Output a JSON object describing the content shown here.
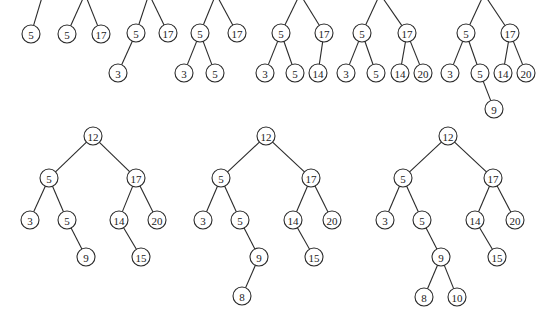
{
  "diagram": {
    "title": "",
    "style": {
      "stroke": "#2a2a2a",
      "node_fill": "#ffffff",
      "text": "#222222",
      "radius": 9
    },
    "trees": [
      {
        "name": "tree-1",
        "nodes": [
          {
            "id": "r",
            "label": "",
            "x": 43,
            "y": -6,
            "hidden": true
          },
          {
            "id": "a",
            "label": "5",
            "x": 31,
            "y": 34
          }
        ],
        "edges": [
          [
            "r",
            "a"
          ]
        ]
      },
      {
        "name": "tree-2",
        "nodes": [
          {
            "id": "r",
            "label": "",
            "x": 85,
            "y": -6,
            "hidden": true
          },
          {
            "id": "a",
            "label": "5",
            "x": 67,
            "y": 34
          },
          {
            "id": "b",
            "label": "17",
            "x": 101,
            "y": 34
          }
        ],
        "edges": [
          [
            "r",
            "a"
          ],
          [
            "r",
            "b"
          ]
        ]
      },
      {
        "name": "tree-3",
        "nodes": [
          {
            "id": "r",
            "label": "",
            "x": 149,
            "y": -6,
            "hidden": true
          },
          {
            "id": "a",
            "label": "5",
            "x": 136,
            "y": 33
          },
          {
            "id": "b",
            "label": "17",
            "x": 168,
            "y": 33
          },
          {
            "id": "c",
            "label": "3",
            "x": 118,
            "y": 73
          }
        ],
        "edges": [
          [
            "r",
            "a"
          ],
          [
            "r",
            "b"
          ],
          [
            "a",
            "c"
          ]
        ]
      },
      {
        "name": "tree-4",
        "nodes": [
          {
            "id": "r",
            "label": "",
            "x": 216,
            "y": -6,
            "hidden": true
          },
          {
            "id": "a",
            "label": "5",
            "x": 200,
            "y": 33
          },
          {
            "id": "b",
            "label": "17",
            "x": 237,
            "y": 33
          },
          {
            "id": "c",
            "label": "3",
            "x": 184,
            "y": 73
          },
          {
            "id": "d",
            "label": "5",
            "x": 215,
            "y": 73
          }
        ],
        "edges": [
          [
            "r",
            "a"
          ],
          [
            "r",
            "b"
          ],
          [
            "a",
            "c"
          ],
          [
            "a",
            "d"
          ]
        ]
      },
      {
        "name": "tree-5",
        "nodes": [
          {
            "id": "r",
            "label": "",
            "x": 300,
            "y": -6,
            "hidden": true
          },
          {
            "id": "a",
            "label": "5",
            "x": 281,
            "y": 33
          },
          {
            "id": "b",
            "label": "17",
            "x": 324,
            "y": 33
          },
          {
            "id": "c",
            "label": "3",
            "x": 265,
            "y": 73
          },
          {
            "id": "d",
            "label": "5",
            "x": 295,
            "y": 73
          },
          {
            "id": "e",
            "label": "14",
            "x": 318,
            "y": 73
          }
        ],
        "edges": [
          [
            "r",
            "a"
          ],
          [
            "r",
            "b"
          ],
          [
            "a",
            "c"
          ],
          [
            "a",
            "d"
          ],
          [
            "b",
            "e"
          ]
        ]
      },
      {
        "name": "tree-6",
        "nodes": [
          {
            "id": "r",
            "label": "",
            "x": 380,
            "y": -6,
            "hidden": true
          },
          {
            "id": "a",
            "label": "5",
            "x": 362,
            "y": 33
          },
          {
            "id": "b",
            "label": "17",
            "x": 407,
            "y": 33
          },
          {
            "id": "c",
            "label": "3",
            "x": 346,
            "y": 73
          },
          {
            "id": "d",
            "label": "5",
            "x": 376,
            "y": 73
          },
          {
            "id": "e",
            "label": "14",
            "x": 400,
            "y": 73
          },
          {
            "id": "f",
            "label": "20",
            "x": 423,
            "y": 73
          }
        ],
        "edges": [
          [
            "r",
            "a"
          ],
          [
            "r",
            "b"
          ],
          [
            "a",
            "c"
          ],
          [
            "a",
            "d"
          ],
          [
            "b",
            "e"
          ],
          [
            "b",
            "f"
          ]
        ]
      },
      {
        "name": "tree-7",
        "nodes": [
          {
            "id": "r",
            "label": "",
            "x": 484,
            "y": -6,
            "hidden": true
          },
          {
            "id": "a",
            "label": "5",
            "x": 466,
            "y": 33
          },
          {
            "id": "b",
            "label": "17",
            "x": 510,
            "y": 33
          },
          {
            "id": "c",
            "label": "3",
            "x": 450,
            "y": 73
          },
          {
            "id": "d",
            "label": "5",
            "x": 480,
            "y": 73
          },
          {
            "id": "e",
            "label": "14",
            "x": 503,
            "y": 73
          },
          {
            "id": "f",
            "label": "20",
            "x": 526,
            "y": 73
          },
          {
            "id": "g",
            "label": "9",
            "x": 494,
            "y": 109
          }
        ],
        "edges": [
          [
            "r",
            "a"
          ],
          [
            "r",
            "b"
          ],
          [
            "a",
            "c"
          ],
          [
            "a",
            "d"
          ],
          [
            "b",
            "e"
          ],
          [
            "b",
            "f"
          ],
          [
            "d",
            "g"
          ]
        ]
      },
      {
        "name": "tree-8",
        "nodes": [
          {
            "id": "r",
            "label": "12",
            "x": 93,
            "y": 136
          },
          {
            "id": "a",
            "label": "5",
            "x": 49,
            "y": 178
          },
          {
            "id": "b",
            "label": "17",
            "x": 136,
            "y": 178
          },
          {
            "id": "c",
            "label": "3",
            "x": 30,
            "y": 220
          },
          {
            "id": "d",
            "label": "5",
            "x": 67,
            "y": 220
          },
          {
            "id": "e",
            "label": "14",
            "x": 119,
            "y": 220
          },
          {
            "id": "f",
            "label": "20",
            "x": 157,
            "y": 220
          },
          {
            "id": "g",
            "label": "9",
            "x": 86,
            "y": 257
          },
          {
            "id": "h",
            "label": "15",
            "x": 141,
            "y": 257
          }
        ],
        "edges": [
          [
            "r",
            "a"
          ],
          [
            "r",
            "b"
          ],
          [
            "a",
            "c"
          ],
          [
            "a",
            "d"
          ],
          [
            "b",
            "e"
          ],
          [
            "b",
            "f"
          ],
          [
            "d",
            "g"
          ],
          [
            "e",
            "h"
          ]
        ]
      },
      {
        "name": "tree-9",
        "nodes": [
          {
            "id": "r",
            "label": "12",
            "x": 266,
            "y": 136
          },
          {
            "id": "a",
            "label": "5",
            "x": 221,
            "y": 178
          },
          {
            "id": "b",
            "label": "17",
            "x": 311,
            "y": 178
          },
          {
            "id": "c",
            "label": "3",
            "x": 203,
            "y": 220
          },
          {
            "id": "d",
            "label": "5",
            "x": 240,
            "y": 220
          },
          {
            "id": "e",
            "label": "14",
            "x": 293,
            "y": 220
          },
          {
            "id": "f",
            "label": "20",
            "x": 332,
            "y": 220
          },
          {
            "id": "g",
            "label": "9",
            "x": 259,
            "y": 257
          },
          {
            "id": "h",
            "label": "15",
            "x": 314,
            "y": 257
          },
          {
            "id": "i",
            "label": "8",
            "x": 242,
            "y": 296
          }
        ],
        "edges": [
          [
            "r",
            "a"
          ],
          [
            "r",
            "b"
          ],
          [
            "a",
            "c"
          ],
          [
            "a",
            "d"
          ],
          [
            "b",
            "e"
          ],
          [
            "b",
            "f"
          ],
          [
            "d",
            "g"
          ],
          [
            "e",
            "h"
          ],
          [
            "g",
            "i"
          ]
        ]
      },
      {
        "name": "tree-10",
        "nodes": [
          {
            "id": "r",
            "label": "12",
            "x": 448,
            "y": 136
          },
          {
            "id": "a",
            "label": "5",
            "x": 403,
            "y": 178
          },
          {
            "id": "b",
            "label": "17",
            "x": 493,
            "y": 178
          },
          {
            "id": "c",
            "label": "3",
            "x": 385,
            "y": 220
          },
          {
            "id": "d",
            "label": "5",
            "x": 422,
            "y": 220
          },
          {
            "id": "e",
            "label": "14",
            "x": 475,
            "y": 220
          },
          {
            "id": "f",
            "label": "20",
            "x": 515,
            "y": 220
          },
          {
            "id": "g",
            "label": "9",
            "x": 441,
            "y": 257
          },
          {
            "id": "h",
            "label": "15",
            "x": 497,
            "y": 257
          },
          {
            "id": "i",
            "label": "8",
            "x": 424,
            "y": 297
          },
          {
            "id": "j",
            "label": "10",
            "x": 457,
            "y": 297
          }
        ],
        "edges": [
          [
            "r",
            "a"
          ],
          [
            "r",
            "b"
          ],
          [
            "a",
            "c"
          ],
          [
            "a",
            "d"
          ],
          [
            "b",
            "e"
          ],
          [
            "b",
            "f"
          ],
          [
            "d",
            "g"
          ],
          [
            "e",
            "h"
          ],
          [
            "g",
            "i"
          ],
          [
            "g",
            "j"
          ]
        ]
      }
    ]
  }
}
